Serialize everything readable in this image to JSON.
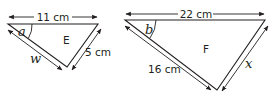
{
  "triangles": [
    {
      "name": "E",
      "top_side": "11 cm",
      "right_side": "5 cm",
      "left_side": "w",
      "angle": "a"
    },
    {
      "name": "F",
      "top_side": "22 cm",
      "left_side": "16 cm",
      "right_side": "x",
      "angle": "b"
    }
  ],
  "colors": {
    "line": "#231f20",
    "background": "#ffffff"
  }
}
